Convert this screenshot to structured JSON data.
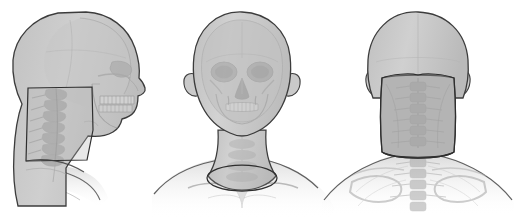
{
  "document": {
    "caption": "",
    "background_color": "#ffffff"
  },
  "palette": {
    "skin": "#c9c9c9",
    "skin_light": "#d8d8d8",
    "skin_dark": "#b4b4b4",
    "bone": "#bdbdbd",
    "bone_light": "#cfcfcf",
    "bone_dark": "#a6a6a6",
    "outline": "#3c3c3c",
    "highlight_region": "#b0b0b0",
    "highlight_outline": "#2e2e2e",
    "shoulder_fade": "#dedede"
  },
  "figures": [
    {
      "id": "lateral",
      "name": "lateral-head-neck-view",
      "label": "Lateral view",
      "orientation": "left lateral profile",
      "structures": [
        "cranium",
        "frontal bone",
        "orbit",
        "nasal bone",
        "maxilla",
        "mandible",
        "upper teeth",
        "lower teeth",
        "cervical vertebrae C1-C7",
        "neck soft tissue"
      ],
      "highlight": {
        "present": true,
        "name": "cervical-region-highlight",
        "description": "rectangular highlighted region over cervical spine"
      }
    },
    {
      "id": "anterior",
      "name": "anterior-head-neck-view",
      "label": "Anterior view",
      "orientation": "frontal",
      "structures": [
        "cranium",
        "frontal bone",
        "left orbit",
        "right orbit",
        "nasal aperture",
        "zygomatic arch",
        "maxilla",
        "mandible",
        "teeth",
        "ears",
        "neck",
        "clavicles",
        "shoulders"
      ],
      "highlight": {
        "present": true,
        "name": "neck-base-highlight",
        "description": "elliptical boundary at base of neck"
      }
    },
    {
      "id": "posterior",
      "name": "posterior-head-neck-view",
      "label": "Posterior view",
      "orientation": "from behind",
      "structures": [
        "occiput",
        "cranium",
        "ears",
        "cervical vertebrae",
        "thoracic vertebrae",
        "scapulae",
        "clavicles",
        "shoulders",
        "posterior neck soft tissue"
      ],
      "highlight": {
        "present": true,
        "name": "posterior-neck-highlight",
        "description": "shaded region covering posterior neck from occiput to shoulders"
      }
    }
  ]
}
